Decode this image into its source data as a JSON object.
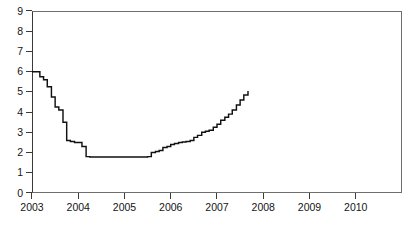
{
  "chart_data": {
    "type": "line",
    "title": "",
    "subtitle": "",
    "xlabel": "",
    "ylabel": "",
    "xlim": [
      2003.0,
      2011.0
    ],
    "ylim": [
      0,
      9
    ],
    "grid": false,
    "legend": null,
    "yticks": [
      0,
      1,
      2,
      3,
      4,
      5,
      6,
      7,
      8,
      9
    ],
    "ytick_labels": [
      "0",
      "1",
      "2",
      "3",
      "4",
      "5",
      "6",
      "7",
      "8",
      "9"
    ],
    "xticks": [
      2003,
      2004,
      2005,
      2006,
      2007,
      2008,
      2009,
      2010
    ],
    "xtick_labels": [
      "2003",
      "2004",
      "2005",
      "2006",
      "2007",
      "2008",
      "2009",
      "2010"
    ],
    "series": [
      {
        "name": "policy rate",
        "color": "#111111",
        "step": "post",
        "x": [
          2003.0,
          2003.08,
          2003.17,
          2003.25,
          2003.33,
          2003.42,
          2003.5,
          2003.58,
          2003.67,
          2003.75,
          2003.83,
          2003.92,
          2004.0,
          2004.08,
          2004.17,
          2004.25,
          2004.33,
          2004.42,
          2004.5,
          2004.58,
          2004.67,
          2004.75,
          2004.83,
          2004.92,
          2005.0,
          2005.08,
          2005.17,
          2005.25,
          2005.33,
          2005.42,
          2005.5,
          2005.58,
          2005.67,
          2005.75,
          2005.83,
          2005.92,
          2006.0,
          2006.08,
          2006.17,
          2006.25,
          2006.33,
          2006.42,
          2006.5,
          2006.58,
          2006.67,
          2006.75,
          2006.83,
          2006.92,
          2007.0,
          2007.08,
          2007.17,
          2007.25,
          2007.33,
          2007.42,
          2007.5,
          2007.58,
          2007.67
        ],
        "values": [
          6.0,
          6.0,
          5.75,
          5.6,
          5.25,
          4.75,
          4.25,
          4.1,
          3.5,
          2.6,
          2.55,
          2.5,
          2.5,
          2.3,
          1.8,
          1.78,
          1.78,
          1.78,
          1.78,
          1.78,
          1.78,
          1.78,
          1.78,
          1.78,
          1.78,
          1.78,
          1.78,
          1.78,
          1.78,
          1.78,
          1.8,
          2.0,
          2.05,
          2.1,
          2.25,
          2.3,
          2.4,
          2.45,
          2.5,
          2.52,
          2.55,
          2.6,
          2.75,
          2.85,
          3.0,
          3.05,
          3.1,
          3.25,
          3.4,
          3.6,
          3.75,
          3.9,
          4.1,
          4.35,
          4.6,
          4.85,
          5.05
        ]
      }
    ]
  },
  "axes": {
    "y_title": "",
    "x_title": ""
  }
}
